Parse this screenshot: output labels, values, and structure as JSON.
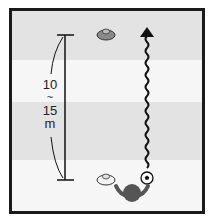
{
  "diagram": {
    "title": "",
    "distance_label": {
      "line1": "10",
      "line2": "~",
      "line3": "15",
      "line4": "m"
    },
    "colors": {
      "frame": "#1a1a1a",
      "band_dark": "#e3e3e3",
      "band_light": "#f6f6f6",
      "cone_fill": "#8a8a8a",
      "cone_light_fill": "#f2f2f2",
      "player": "#555555",
      "path": "#111111"
    },
    "elements": [
      {
        "type": "cone",
        "name": "top-cone",
        "fill": "dark"
      },
      {
        "type": "cone",
        "name": "bottom-cone",
        "fill": "light"
      },
      {
        "type": "player",
        "name": "player"
      },
      {
        "type": "ball",
        "name": "soccer-ball"
      },
      {
        "type": "dribble-path",
        "name": "wavy-dribble-arrow",
        "direction": "up"
      },
      {
        "type": "measurement",
        "name": "distance-marker",
        "label": "10 ~ 15 m"
      }
    ]
  }
}
